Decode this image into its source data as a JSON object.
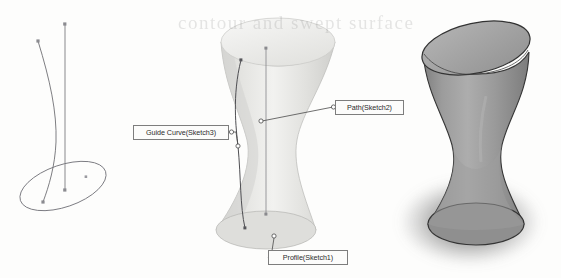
{
  "figure": {
    "type": "cad-sweep-illustration",
    "background_color": "#fdfdfc",
    "ghost_text": "contour and swept surface",
    "panels": [
      {
        "name": "wireframe-sketch",
        "description": "Wireframe of profile ellipse, vertical path line and guide curve",
        "line_color": "#6f6f72"
      },
      {
        "name": "shaded-preview",
        "description": "Light shaded hourglass solid with sketch callouts",
        "surface_color": "#e9e9e7",
        "surface_shadow_color": "#c4c4c2"
      },
      {
        "name": "rendered-solid",
        "description": "Final rendered hourglass solid of revolution with drop shadow",
        "surface_color": "#9b9b9b",
        "top_face_color": "#a6a6a6",
        "outline_color": "#3a3a3a",
        "shadow_color": "#5d5d5d"
      }
    ]
  },
  "callouts": {
    "guide_curve": {
      "label": "Guide Curve(Sketch3)",
      "anchor_x": 236,
      "anchor_y": 132
    },
    "path": {
      "label": "Path(Sketch2)",
      "anchor_x": 262,
      "anchor_y": 120
    },
    "profile": {
      "label": "Profile(Sketch1)",
      "anchor_x": 274,
      "anchor_y": 236
    }
  },
  "geometry": {
    "sketch": {
      "path_line": {
        "x": 65,
        "y_top": 24,
        "y_bottom": 190
      },
      "profile_ellipse": {
        "cx": 63,
        "cy": 186,
        "rx": 45,
        "ry": 21,
        "rotation": -19
      },
      "guide_curve_endpoints": [
        {
          "x": 38,
          "y": 41
        },
        {
          "x": 43,
          "y": 202
        }
      ]
    },
    "preview_solid": {
      "top_ellipse": {
        "cx": 278,
        "cy": 42,
        "rx": 57,
        "ry": 24
      },
      "bottom_ellipse": {
        "cx": 266,
        "cy": 230,
        "rx": 50,
        "ry": 20
      },
      "waist_y": 140
    },
    "rendered_solid": {
      "top_ellipse": {
        "cx": 476,
        "cy": 48,
        "rx": 55,
        "ry": 25
      },
      "bottom_ellipse": {
        "cx": 476,
        "cy": 227,
        "rx": 48,
        "ry": 22
      },
      "waist_y": 145
    }
  }
}
